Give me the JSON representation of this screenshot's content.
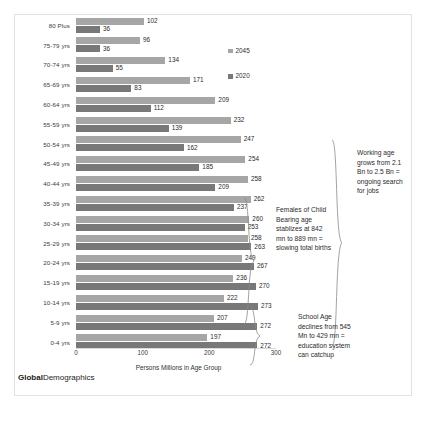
{
  "brand": {
    "bold": "Global",
    "light": "Demographics"
  },
  "legend": {
    "position": "inside-top-right",
    "items": [
      {
        "label": "2045",
        "color": "#a6a6a6"
      },
      {
        "label": "2020",
        "color": "#787878"
      }
    ]
  },
  "annotations": [
    {
      "name": "females-child-bearing-note",
      "text": "Females of Child Bearing age stablizes at 842 mn to 889 mn = slowing total births"
    },
    {
      "name": "working-age-note",
      "text": "Working age grows from 2.1 Bn to 2.5 Bn = ongoing search for jobs"
    },
    {
      "name": "school-age-note",
      "text": "School Age declines from 545 Mn to 429 mn = education system can catchup"
    }
  ],
  "chart_data": {
    "type": "bar",
    "orientation": "horizontal",
    "title": "",
    "xlabel": "Persons Millions in Age Group",
    "ylabel": "",
    "xlim": [
      0,
      300
    ],
    "xticks": [
      0,
      100,
      200,
      300
    ],
    "grid": false,
    "categories": [
      "80 Plus",
      "75-79 yrs",
      "70-74 yrs",
      "65-69 yrs",
      "60-64 yrs",
      "55-59 yrs",
      "50-54 yrs",
      "45-49 yrs",
      "40-44 yrs",
      "35-39 yrs",
      "30-34 yrs",
      "25-29 yrs",
      "20-24 yrs",
      "15-19 yrs",
      "10-14 yrs",
      "5-9 yrs",
      "0-4 yrs"
    ],
    "series": [
      {
        "name": "2045",
        "color": "#a6a6a6",
        "values": [
          102,
          96,
          134,
          171,
          209,
          232,
          247,
          254,
          258,
          262,
          260,
          258,
          249,
          236,
          222,
          207,
          197
        ]
      },
      {
        "name": "2020",
        "color": "#787878",
        "values": [
          36,
          36,
          55,
          83,
          112,
          139,
          162,
          185,
          209,
          237,
          253,
          263,
          267,
          270,
          273,
          272,
          272
        ]
      }
    ]
  }
}
